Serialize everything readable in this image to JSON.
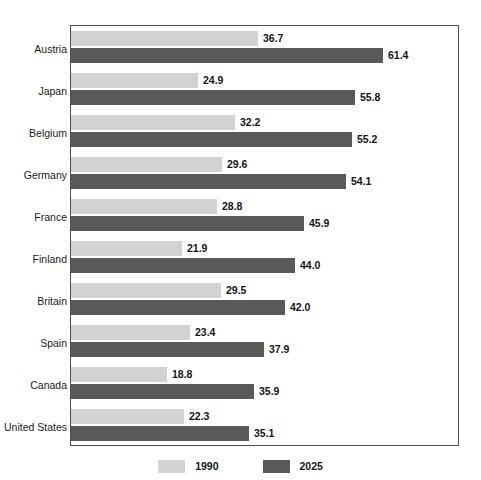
{
  "chart_data": {
    "type": "bar",
    "orientation": "horizontal",
    "title": "",
    "subtitle": "",
    "xlabel": "",
    "ylabel": "",
    "grid": false,
    "xlim": [
      0,
      76
    ],
    "legend_position": "bottom-center",
    "categories": [
      "Austria",
      "Japan",
      "Belgium",
      "Germany",
      "France",
      "Finland",
      "Britain",
      "Spain",
      "Canada",
      "United States"
    ],
    "series": [
      {
        "name": "1990",
        "color": "#d2d2d2",
        "values": [
          36.7,
          24.9,
          32.2,
          29.6,
          28.8,
          21.9,
          29.5,
          23.4,
          18.8,
          22.3
        ],
        "labels": [
          "36.7",
          "24.9",
          "32.2",
          "29.6",
          "28.8",
          "21.9",
          "29.5",
          "23.4",
          "18.8",
          "22.3"
        ]
      },
      {
        "name": "2025",
        "color": "#595959",
        "values": [
          61.4,
          55.8,
          55.2,
          54.1,
          45.9,
          44.0,
          42.0,
          37.9,
          35.9,
          35.1
        ],
        "labels": [
          "61.4",
          "55.8",
          "55.2",
          "54.1",
          "45.9",
          "44.0",
          "42.0",
          "37.9",
          "35.9",
          "35.1"
        ]
      }
    ]
  },
  "legend": {
    "items": [
      {
        "label": "1990",
        "color": "#d2d2d2"
      },
      {
        "label": "2025",
        "color": "#595959"
      }
    ]
  },
  "colors": {
    "series_1990": "#d2d2d2",
    "series_2025": "#595959",
    "frame": "#4f4f4f",
    "text": "#1a1a1a",
    "background": "#ffffff"
  }
}
